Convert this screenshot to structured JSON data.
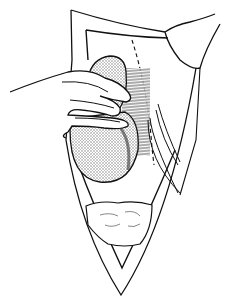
{
  "figure": {
    "kind": "surgical line illustration",
    "colors": {
      "background": "#ffffff",
      "ink": "#111111",
      "stipple": "#9a9a9a"
    }
  }
}
